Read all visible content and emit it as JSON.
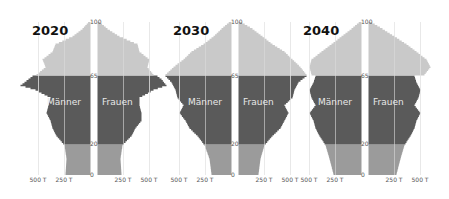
{
  "chart_data": {
    "type": "population-pyramid",
    "colors": {
      "age_0_19": "#9b9b9b",
      "age_20_64": "#5a5a5a",
      "age_65_plus": "#c9c9c9",
      "grid": "#e2e2e2"
    },
    "sex_labels": {
      "male": "Männer",
      "female": "Frauen"
    },
    "x_ticks": [
      "500 T",
      "250 T",
      "250 T",
      "500 T"
    ],
    "age_ticks": [
      "100",
      "65",
      "20",
      "0"
    ],
    "panels": [
      {
        "title": "2020",
        "center": 94,
        "male_halfwidth": {
          "0": 25,
          "10": 24,
          "19": 26,
          "25": 34,
          "30": 38,
          "35": 40,
          "40": 44,
          "45": 42,
          "50": 40,
          "55": 55,
          "58": 70,
          "62": 62,
          "64": 58,
          "65": 54,
          "70": 45,
          "75": 48,
          "80": 38,
          "85": 35,
          "90": 18,
          "95": 8,
          "100": 1
        },
        "female_halfwidth": {
          "0": 24,
          "10": 23,
          "19": 25,
          "25": 34,
          "30": 38,
          "35": 44,
          "40": 44,
          "45": 42,
          "50": 42,
          "55": 56,
          "58": 69,
          "62": 64,
          "64": 60,
          "65": 56,
          "70": 50,
          "75": 52,
          "80": 42,
          "85": 40,
          "90": 22,
          "95": 10,
          "100": 1
        }
      },
      {
        "title": "2030",
        "center": 235,
        "male_halfwidth": {
          "0": 20,
          "10": 22,
          "19": 27,
          "25": 34,
          "30": 42,
          "35": 46,
          "40": 52,
          "45": 48,
          "50": 54,
          "55": 56,
          "60": 60,
          "64": 66,
          "65": 66,
          "70": 58,
          "75": 48,
          "80": 40,
          "85": 28,
          "90": 18,
          "95": 10,
          "100": 1
        },
        "female_halfwidth": {
          "0": 20,
          "10": 22,
          "19": 26,
          "25": 34,
          "30": 42,
          "35": 46,
          "40": 50,
          "45": 46,
          "50": 54,
          "55": 56,
          "60": 60,
          "64": 68,
          "65": 68,
          "70": 62,
          "75": 54,
          "80": 46,
          "85": 34,
          "90": 24,
          "95": 14,
          "100": 1
        }
      },
      {
        "title": "2040",
        "center": 365,
        "male_halfwidth": {
          "0": 28,
          "10": 32,
          "19": 36,
          "25": 42,
          "30": 46,
          "35": 48,
          "40": 52,
          "45": 46,
          "50": 50,
          "55": 52,
          "60": 48,
          "64": 46,
          "65": 50,
          "70": 52,
          "75": 50,
          "80": 40,
          "85": 30,
          "90": 20,
          "95": 10,
          "100": 1
        },
        "female_halfwidth": {
          "0": 28,
          "10": 32,
          "19": 36,
          "25": 42,
          "30": 46,
          "35": 48,
          "40": 52,
          "45": 46,
          "50": 50,
          "55": 52,
          "60": 48,
          "64": 46,
          "65": 56,
          "70": 62,
          "75": 58,
          "80": 48,
          "85": 38,
          "90": 26,
          "95": 14,
          "100": 1
        }
      }
    ]
  }
}
